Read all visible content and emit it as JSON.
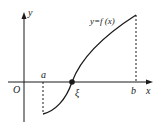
{
  "diagram": {
    "axes": {
      "x_label": "x",
      "y_label": "y",
      "origin_label": "O"
    },
    "curve_label": "y=f (x)",
    "points": {
      "a": "a",
      "b": "b",
      "xi": "ξ"
    },
    "colors": {
      "line": "#1a1a1a",
      "background": "#ffffff"
    }
  }
}
